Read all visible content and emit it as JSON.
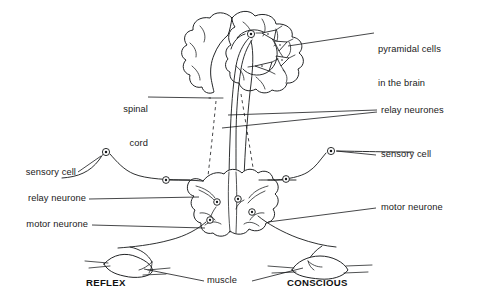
{
  "figure": {
    "background_color": "#ffffff",
    "ink_color": "#16181a",
    "width": 477,
    "height": 304
  },
  "labels": {
    "pyramidal_cells_line1": "pyramidal cells",
    "pyramidal_cells_line2": "in the brain",
    "spinal_cord_line1": "spinal",
    "spinal_cord_line2": "cord",
    "relay_neurones_right": "relay neurones",
    "sensory_cell_left": "sensory cell",
    "sensory_cell_right": "sensory cell",
    "relay_neurone_left": "relay neurone",
    "motor_neurone_left": "motor neurone",
    "motor_neurone_right": "motor neurone",
    "muscle": "muscle",
    "reflex": "REFLEX",
    "conscious": "CONSCIOUS"
  },
  "structures": [
    {
      "name": "brain",
      "kind": "organ-outline"
    },
    {
      "name": "spinal-cord-stem",
      "kind": "tract"
    },
    {
      "name": "spinal-cord-cross-section",
      "kind": "grey-matter-butterfly"
    },
    {
      "name": "muscle-reflex",
      "kind": "muscle-spindle"
    },
    {
      "name": "muscle-conscious",
      "kind": "muscle-spindle"
    }
  ],
  "cell_bodies": [
    {
      "name": "pyramidal-cell-body-brain",
      "x": 251,
      "y": 34
    },
    {
      "name": "sensory-cell-body-left",
      "x": 105,
      "y": 152
    },
    {
      "name": "sensory-cell-body-right",
      "x": 331,
      "y": 151
    },
    {
      "name": "relay-cell-body-left-cord",
      "x": 166,
      "y": 180
    },
    {
      "name": "relay-cell-body-right-cord",
      "x": 286,
      "y": 179
    },
    {
      "name": "cord-cell-upper-left",
      "x": 216,
      "y": 206
    },
    {
      "name": "cord-cell-lower-left",
      "x": 210,
      "y": 220
    },
    {
      "name": "cord-cell-upper-right",
      "x": 238,
      "y": 201
    },
    {
      "name": "cord-cell-right",
      "x": 252,
      "y": 212
    }
  ],
  "pyramidal_cells": [
    {
      "name": "pyramidal-cell-1",
      "x": 268,
      "y": 36
    },
    {
      "name": "pyramidal-cell-2",
      "x": 280,
      "y": 46
    },
    {
      "name": "pyramidal-cell-3",
      "x": 283,
      "y": 60
    },
    {
      "name": "pyramidal-cell-4",
      "x": 265,
      "y": 64
    }
  ]
}
